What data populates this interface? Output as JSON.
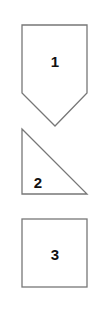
{
  "diagram": {
    "shapes": [
      {
        "type": "pentagon-arrow",
        "label": "1"
      },
      {
        "type": "right-triangle",
        "label": "2"
      },
      {
        "type": "square",
        "label": "3"
      }
    ],
    "colors": {
      "stroke": "#777777",
      "text": "#111111",
      "background": "#ffffff"
    }
  }
}
